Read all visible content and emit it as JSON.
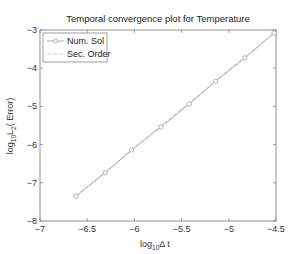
{
  "chart_data": {
    "type": "line",
    "title": "Temporal convergence plot for Temperature",
    "xlabel": "log10 Δt",
    "ylabel": "log10 L2( Error)",
    "xlim": [
      -7,
      -4.5
    ],
    "ylim": [
      -8,
      -3
    ],
    "xticks": [
      "-7",
      "-6.5",
      "-6",
      "-5.5",
      "-5",
      "-4.5"
    ],
    "yticks": [
      "-3",
      "-4",
      "-5",
      "-6",
      "-7",
      "-8"
    ],
    "grid": false,
    "legend_position": "upper left",
    "series": [
      {
        "name": "Num. Sol",
        "style": "solid line with circle markers",
        "color": "#a0a0a0",
        "x": [
          -6.62,
          -6.31,
          -6.03,
          -5.72,
          -5.42,
          -5.14,
          -4.83,
          -4.52
        ],
        "y": [
          -7.35,
          -6.74,
          -6.14,
          -5.54,
          -4.94,
          -4.34,
          -3.73,
          -3.08
        ]
      },
      {
        "name": "Sec. Order",
        "style": "dashed line",
        "color": "#c8c8c8",
        "x": [
          -6.62,
          -4.52
        ],
        "y": [
          -7.35,
          -3.08
        ]
      }
    ]
  },
  "labels": {
    "title": "Temporal convergence plot for Temperature",
    "xlabel_main": "log",
    "xlabel_sub": "10",
    "xlabel_rest": "Δ t",
    "ylabel_main": "log",
    "ylabel_sub1": "10",
    "ylabel_mid": "L",
    "ylabel_sub2": "2",
    "ylabel_rest": "( Error)",
    "legend_num": "Num. Sol",
    "legend_sec": "Sec. Order"
  }
}
